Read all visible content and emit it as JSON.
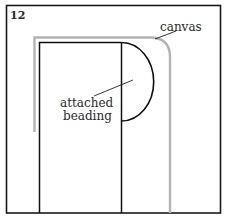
{
  "figure": {
    "number": "12",
    "labels": {
      "canvas": "canvas",
      "attached_line1": "attached",
      "attached_line2": "beading"
    },
    "colors": {
      "frame": "#1a1a1a",
      "canvas_line": "#b3b3b3",
      "ink": "#111111"
    }
  }
}
